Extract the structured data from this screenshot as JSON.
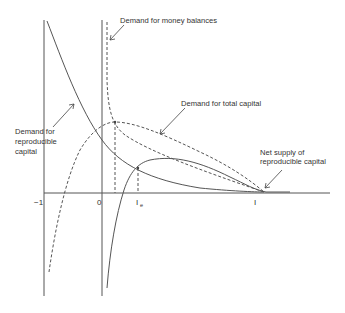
{
  "diagram": {
    "labels": {
      "money": "Demand for money balances",
      "total": "Demand for total capital",
      "repro_1": "Demand for",
      "repro_2": "reproducible",
      "repro_3": "capital",
      "supply_1": "Net supply of",
      "supply_2": "reproducible capital"
    },
    "ticks": {
      "minus_one": "−1",
      "zero": "0",
      "i_e": "I",
      "i_e_sub": "e",
      "i": "I"
    }
  }
}
